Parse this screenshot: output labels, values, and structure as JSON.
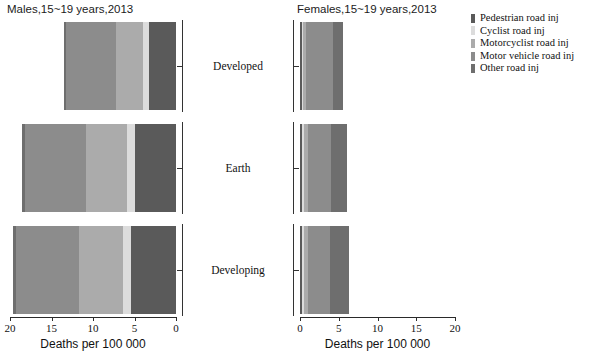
{
  "male_panel": {
    "title": "Males,15~19 years,2013"
  },
  "female_panel": {
    "title": "Females,15~19 years,2013"
  },
  "axis": {
    "xlabel": "Deaths per 100 000",
    "male_ticks": [
      "20",
      "15",
      "10",
      "5",
      "0"
    ],
    "female_ticks": [
      "0",
      "5",
      "10",
      "15",
      "20"
    ]
  },
  "categories": [
    "Developed",
    "Earth",
    "Developing"
  ],
  "legend": {
    "items": [
      {
        "label": "Pedestrian road inj",
        "color": "#5a5a5a"
      },
      {
        "label": "Cyclist  road inj",
        "color": "#dcdcdc"
      },
      {
        "label": "Motorcyclist road inj",
        "color": "#ababab"
      },
      {
        "label": "Motor vehicle road inj",
        "color": "#8c8c8c"
      },
      {
        "label": "Other road inj",
        "color": "#6e6e6e"
      }
    ]
  },
  "chart_data": {
    "type": "bar",
    "subtype": "back-to-back stacked horizontal bar (population pyramid)",
    "xlabel": "Deaths per 100 000",
    "ylabel": "",
    "categories": [
      "Developed",
      "Earth",
      "Developing"
    ],
    "legend_position": "right",
    "grid": false,
    "panels": [
      {
        "name": "Males,15~19 years,2013",
        "direction": "right-to-left",
        "xlim": [
          0,
          20
        ],
        "xticks": [
          20,
          15,
          10,
          5,
          0
        ],
        "series": [
          {
            "name": "Pedestrian road inj",
            "color": "#5a5a5a",
            "values": [
              3.3,
              5.0,
              5.4
            ]
          },
          {
            "name": "Cyclist  road inj",
            "color": "#dcdcdc",
            "values": [
              0.7,
              0.9,
              1.0
            ]
          },
          {
            "name": "Motorcyclist road inj",
            "color": "#ababab",
            "values": [
              3.2,
              5.0,
              5.3
            ]
          },
          {
            "name": "Motor vehicle road inj",
            "color": "#8c8c8c",
            "values": [
              6.1,
              7.3,
              7.6
            ]
          },
          {
            "name": "Other road inj",
            "color": "#6e6e6e",
            "values": [
              0.2,
              0.3,
              0.3
            ]
          }
        ],
        "totals": [
          13.5,
          18.5,
          19.6
        ]
      },
      {
        "name": "Females,15~19 years,2013",
        "direction": "left-to-right",
        "xlim": [
          0,
          20
        ],
        "xticks": [
          0,
          5,
          10,
          15,
          20
        ],
        "series": [
          {
            "name": "Pedestrian road inj",
            "color": "#5a5a5a",
            "values": [
              0.2,
              0.2,
              0.2
            ]
          },
          {
            "name": "Cyclist  road inj",
            "color": "#dcdcdc",
            "values": [
              0.2,
              0.3,
              0.3
            ]
          },
          {
            "name": "Motorcyclist road inj",
            "color": "#ababab",
            "values": [
              0.4,
              0.5,
              0.5
            ]
          },
          {
            "name": "Motor vehicle road inj",
            "color": "#8c8c8c",
            "values": [
              3.5,
              3.0,
              2.9
            ]
          },
          {
            "name": "Other road inj",
            "color": "#6e6e6e",
            "values": [
              1.3,
              2.1,
              2.4
            ]
          }
        ],
        "totals": [
          5.6,
          6.1,
          6.3
        ]
      }
    ]
  },
  "geometry": {
    "male_plot_left": 10,
    "male_plot_width": 166,
    "female_plot_left": 300,
    "female_plot_width": 155,
    "row_tops": [
      22,
      124,
      226
    ],
    "row_height": 88,
    "max_value": 20
  }
}
